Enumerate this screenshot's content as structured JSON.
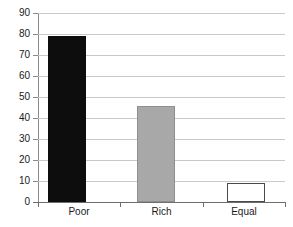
{
  "chart_data": {
    "type": "bar",
    "title": "",
    "xlabel": "",
    "ylabel": "",
    "categories": [
      "Poor",
      "Rich",
      "Equal"
    ],
    "values": [
      79,
      45.5,
      9
    ],
    "ylim": [
      0,
      90
    ],
    "ytick_step": 10,
    "yticks": [
      90,
      80,
      70,
      60,
      50,
      40,
      30,
      20,
      10,
      0
    ],
    "ytick_labels": [
      "90",
      "80",
      "70",
      "60",
      "50",
      "40",
      "30",
      "20",
      "10",
      "0"
    ],
    "grid": true,
    "grid_axis": "y",
    "legend": false,
    "bar_styles": [
      {
        "category": "Poor",
        "fill": "#0d0d0d",
        "edge": "#0d0d0d",
        "style": "solid-dark"
      },
      {
        "category": "Rich",
        "fill": "#a8a8a8",
        "edge": "#8f8f8f",
        "style": "solid-gray"
      },
      {
        "category": "Equal",
        "fill": "#ffffff",
        "edge": "#4a4a4a",
        "style": "outline-white"
      }
    ],
    "colors": {
      "background": "#ffffff",
      "gridline": "#c9c9c9",
      "axis": "#6e6e6e",
      "text": "#1a1a1a"
    }
  }
}
